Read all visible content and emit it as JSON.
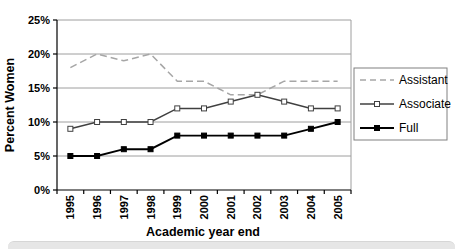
{
  "page": {
    "background": "#ffffff",
    "bottom_strip_color": "#e6e6e6"
  },
  "chart_data": {
    "type": "line",
    "title": "",
    "xlabel": "Academic year end",
    "ylabel": "Percent Women",
    "categories": [
      "1995",
      "1996",
      "1997",
      "1998",
      "1999",
      "2000",
      "2001",
      "2002",
      "2003",
      "2004",
      "2005"
    ],
    "series": [
      {
        "name": "Assistant",
        "values": [
          18,
          20,
          19,
          20,
          16,
          16,
          14,
          14,
          16,
          16,
          16
        ],
        "color": "#a6a6a6",
        "style": "dashed",
        "marker": "none"
      },
      {
        "name": "Associate",
        "values": [
          9,
          10,
          10,
          10,
          12,
          12,
          13,
          14,
          13,
          12,
          12
        ],
        "color": "#404040",
        "style": "solid",
        "marker": "open-square"
      },
      {
        "name": "Full",
        "values": [
          5,
          5,
          6,
          6,
          8,
          8,
          8,
          8,
          8,
          9,
          10
        ],
        "color": "#000000",
        "style": "solid",
        "marker": "filled-square"
      }
    ],
    "ylim": [
      0,
      25
    ],
    "ytick_step": 5,
    "ytick_labels": [
      "0%",
      "5%",
      "10%",
      "15%",
      "20%",
      "25%"
    ],
    "grid": true,
    "grid_color": "#9e9e9e",
    "axis_color": "#000000",
    "legend_position": "right",
    "legend_border_color": "#808080"
  },
  "legend": {
    "items": [
      "Assistant",
      "Associate",
      "Full"
    ]
  }
}
